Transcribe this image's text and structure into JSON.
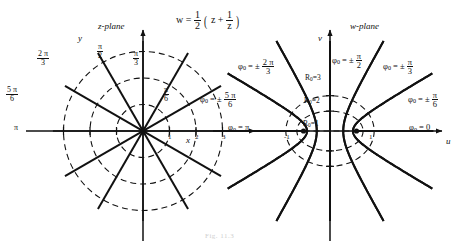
{
  "figure": {
    "caption": "Fig. 11.3",
    "mapping_formula": {
      "lhs": "w",
      "eq": "=",
      "coef_num": "1",
      "coef_den": "2",
      "open": "(",
      "z": "z",
      "plus": "+",
      "inv_num": "1",
      "inv_den": "z",
      "close": ")"
    }
  },
  "z_plane": {
    "title": "z-plane",
    "axis_x": "x",
    "axis_y": "y",
    "tick_labels": [
      "1",
      "2",
      "3"
    ],
    "radial_labels": [
      {
        "text_num": "π",
        "text_den": "6",
        "simple": null,
        "angle_deg": 30
      },
      {
        "text_num": "π",
        "text_den": "3",
        "simple": null,
        "angle_deg": 60
      },
      {
        "text_num": "π",
        "text_den": "2",
        "simple": null,
        "angle_deg": 90
      },
      {
        "text_num": "2 π",
        "text_den": "3",
        "simple": null,
        "angle_deg": 120
      },
      {
        "text_num": "5 π",
        "text_den": "6",
        "simple": null,
        "angle_deg": 150
      },
      {
        "text_num": null,
        "text_den": null,
        "simple": "π",
        "angle_deg": 180
      }
    ]
  },
  "w_plane": {
    "title": "w-plane",
    "axis_u": "u",
    "axis_v": "v",
    "branch_point_left": "-1",
    "branch_point_right": "1",
    "phi_symbol": "φ",
    "phi_sub": "0",
    "equals": "=",
    "plus_minus": "±",
    "ellipse_labels": [
      {
        "name": "R",
        "sub": "0",
        "eq": "=",
        "value": "1"
      },
      {
        "name": "R",
        "sub": "0",
        "eq": "=",
        "value": "2"
      },
      {
        "name": "R",
        "sub": "0",
        "eq": "=",
        "value": "3"
      }
    ],
    "hyperbola_labels": [
      {
        "pm": false,
        "num": null,
        "den": null,
        "simple": "0",
        "angle_deg": 0
      },
      {
        "pm": true,
        "num": "π",
        "den": "6",
        "simple": null,
        "angle_deg": 30
      },
      {
        "pm": true,
        "num": "π",
        "den": "3",
        "simple": null,
        "angle_deg": 60
      },
      {
        "pm": true,
        "num": "π",
        "den": "2",
        "simple": null,
        "angle_deg": 90
      },
      {
        "pm": true,
        "num": "2 π",
        "den": "3",
        "simple": null,
        "angle_deg": 120
      },
      {
        "pm": true,
        "num": "5 π",
        "den": "6",
        "simple": null,
        "angle_deg": 150
      },
      {
        "pm": false,
        "num": null,
        "den": null,
        "simple": "π",
        "angle_deg": 180
      }
    ]
  },
  "chart_data": {
    "type": "line",
    "transform": "joukowski",
    "z_plane": {
      "center_px": [
        143,
        131
      ],
      "unit_px": 26.5,
      "radii": [
        1,
        2,
        3
      ],
      "ray_angles_deg": [
        0,
        30,
        60,
        90,
        120,
        150,
        180,
        210,
        240,
        270,
        300,
        330
      ],
      "ray_max_radius": 3.4,
      "circle_style": "dashed",
      "ray_style": "solid",
      "xlim": [
        -3.6,
        3.6
      ],
      "ylim": [
        -3.6,
        3.6
      ]
    },
    "w_plane": {
      "center_px": [
        330,
        131
      ],
      "unit_px": 26.5,
      "ellipses_R0": [
        1,
        2,
        3
      ],
      "ellipse_semi_axes": [
        {
          "R0": 1,
          "a": 1.0,
          "b": 0.0
        },
        {
          "R0": 2,
          "a": 1.25,
          "b": 0.75
        },
        {
          "R0": 3,
          "a": 1.6667,
          "b": 1.3333
        }
      ],
      "hyperbolas_phi0_deg": [
        0,
        30,
        60,
        90,
        120,
        150,
        180
      ],
      "hyperbola_semi_axes": [
        {
          "phi0_deg": 30,
          "a": 0.866,
          "b": 0.5
        },
        {
          "phi0_deg": 60,
          "a": 0.5,
          "b": 0.866
        },
        {
          "phi0_deg": 90,
          "a": 0.0,
          "b": 1.0
        },
        {
          "phi0_deg": 120,
          "a": -0.5,
          "b": 0.866
        },
        {
          "phi0_deg": 150,
          "a": -0.866,
          "b": 0.5
        }
      ],
      "foci": [
        -1,
        1
      ],
      "ellipse_style": "dashed",
      "hyperbola_style": "solid",
      "xlim": [
        -3.6,
        3.6
      ],
      "ylim": [
        -3.6,
        3.6
      ]
    }
  }
}
